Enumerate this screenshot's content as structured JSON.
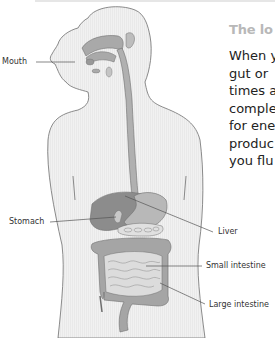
{
  "heading": "The lo",
  "body_lines": [
    "When y",
    "gut or",
    "times a",
    "comple",
    "for ene",
    "produc",
    "you flu"
  ],
  "figure": {
    "labels": {
      "mouth": "Mouth",
      "stomach": "Stomach",
      "liver": "Liver",
      "small_intestine": "Small intestine",
      "large_intestine": "Large intestine"
    },
    "colors": {
      "body_fill": "#f0f0f0",
      "outline": "#6e6e6e",
      "organ_fill": "#a9a9a9",
      "organ_dark": "#8c8c8c",
      "leader_line": "#555555"
    }
  }
}
